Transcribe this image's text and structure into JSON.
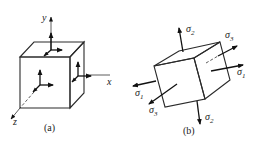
{
  "figure": {
    "panel_a": {
      "caption": "(a)",
      "axis_labels": {
        "x": "x",
        "y": "y",
        "z": "z"
      },
      "description": "Cube element aligned with x, y, z axes showing stress component arrows on three visible faces"
    },
    "panel_b": {
      "caption": "(b)",
      "stress_labels": {
        "top": "σ2",
        "bottom": "σ2",
        "right_upper": "σ3",
        "right_lower": "σ1",
        "left_upper": "σ1",
        "left_lower": "σ3"
      },
      "description": "Rotated cube element with principal stresses σ1, σ2, σ3 acting on faces"
    }
  },
  "colors": {
    "line": "#2a2a2a",
    "text": "#222222",
    "background": "#ffffff"
  }
}
